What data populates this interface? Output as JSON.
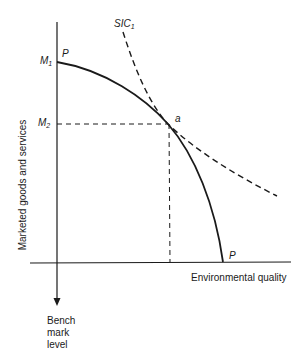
{
  "diagram": {
    "y_axis_label": "Marketed goods and services",
    "x_axis_label": "Environmental quality",
    "benchmark_label": [
      "Bench",
      "mark",
      "level"
    ],
    "curve_labels": {
      "ppf_top": "P",
      "ppf_bottom": "P",
      "sic": "SIC",
      "sic_sub": "1"
    },
    "point_labels": {
      "tangency": "a",
      "m1": "M",
      "m1_sub": "1",
      "m2": "M",
      "m2_sub": "2"
    },
    "colors": {
      "line": "#1a1a1a",
      "background": "#ffffff"
    }
  }
}
